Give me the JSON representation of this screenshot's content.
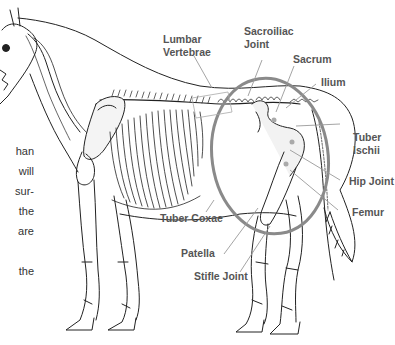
{
  "figure": {
    "colors": {
      "label_text": "#555555",
      "leader_line": "#9a9a9a",
      "highlight_ellipse": "#8a8a8a",
      "bone_outline": "#222222",
      "background": "#ffffff"
    }
  },
  "labels": {
    "lumbar_vertebrae": "Lumbar\nVertebrae",
    "lumbar_line1": "Lumbar",
    "lumbar_line2": "Vertebrae",
    "sacroiliac_line1": "Sacroiliac",
    "sacroiliac_line2": "Joint",
    "sacrum": "Sacrum",
    "ilium": "Ilium",
    "tuber_ischii_line1": "Tuber",
    "tuber_ischii_line2": "Ischii",
    "hip_joint": "Hip Joint",
    "femur": "Femur",
    "tuber_coxae": "Tuber Coxae",
    "patella": "Patella",
    "stifle_joint": "Stifle Joint"
  },
  "body_text_fragments": [
    "han",
    "will",
    "sur-",
    "the",
    "are",
    "",
    "the"
  ]
}
